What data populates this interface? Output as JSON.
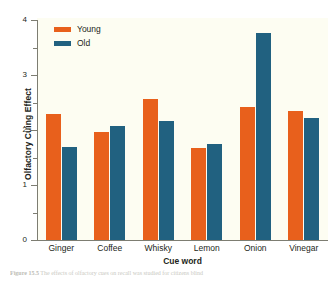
{
  "chart_data": {
    "type": "bar",
    "title": "",
    "xlabel": "Cue word",
    "ylabel": "Olfactory Cuing Effect",
    "ylim": [
      0,
      4
    ],
    "yticks": [
      0,
      1,
      2,
      3,
      4
    ],
    "ytick_labels": [
      "0",
      "1",
      "2",
      "3",
      "4"
    ],
    "yminor_ticks": [
      0.5,
      1.5,
      2.5,
      3.5
    ],
    "grid": false,
    "legend_position": "upper-left",
    "categories": [
      "Ginger",
      "Coffee",
      "Whisky",
      "Lemon",
      "Onion",
      "Vinegar"
    ],
    "series": [
      {
        "name": "Young",
        "color": "#e8601c",
        "values": [
          2.3,
          1.97,
          2.57,
          1.68,
          2.42,
          2.34
        ]
      },
      {
        "name": "Old",
        "color": "#216180",
        "values": [
          1.7,
          2.08,
          2.17,
          1.75,
          3.76,
          2.21
        ]
      }
    ]
  },
  "legend": {
    "items": [
      {
        "label": "Young",
        "color": "#e8601c"
      },
      {
        "label": "Old",
        "color": "#216180"
      }
    ]
  },
  "axes": {
    "y_title": "Olfactory Cuing Effect",
    "x_title": "Cue word"
  },
  "caption": {
    "figure_number": "Figure 15.5",
    "text": "The effects of olfactory cues on recall was studied for citizens blind"
  },
  "colors": {
    "young": "#e8601c",
    "old": "#216180",
    "panel_background": "#fdfdf2",
    "axis": "#7d7d72",
    "text": "#231f20"
  }
}
